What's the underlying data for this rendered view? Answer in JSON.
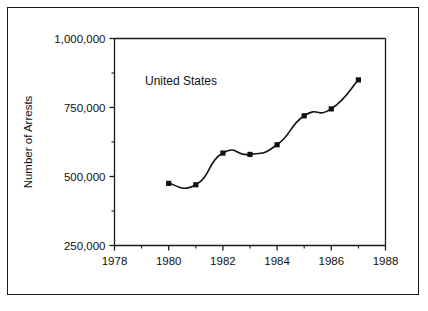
{
  "chart_data": {
    "type": "line",
    "title": "",
    "subtitle": "",
    "xlabel": "",
    "ylabel": "Number of Arrests",
    "annotation": "United States",
    "x": [
      1980,
      1981,
      1982,
      1983,
      1984,
      1985,
      1986,
      1987
    ],
    "series": [
      {
        "name": "United States",
        "values": [
          475000,
          470000,
          585000,
          580000,
          615000,
          720000,
          745000,
          850000
        ]
      }
    ],
    "xlim": [
      1978,
      1988
    ],
    "ylim": [
      250000,
      1000000
    ],
    "xticks": [
      1978,
      1980,
      1982,
      1984,
      1986,
      1988
    ],
    "xtick_labels": [
      "1978",
      "1980",
      "1982",
      "1984",
      "1986",
      "1988"
    ],
    "x_minor_ticks": [
      1979,
      1981,
      1983,
      1985,
      1987
    ],
    "yticks": [
      250000,
      500000,
      750000,
      1000000
    ],
    "ytick_labels": [
      "250,000",
      "500,000",
      "750,000",
      "1,000,000"
    ],
    "y_minor_ticks": [
      375000,
      625000,
      875000
    ],
    "grid": false,
    "legend_position": "none",
    "marker": "square",
    "line_color": "#111111",
    "marker_color": "#111111",
    "background_color": "#ffffff",
    "frame_color": "#1a1a1a"
  }
}
